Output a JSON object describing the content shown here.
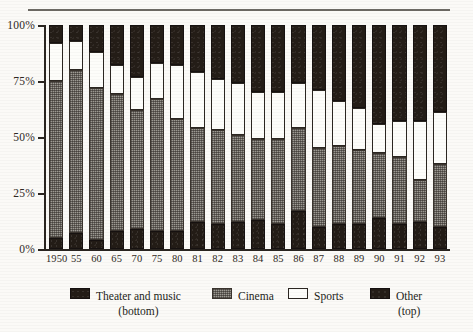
{
  "chart_data": {
    "type": "bar",
    "title": "",
    "xlabel": "",
    "ylabel": "",
    "ylim": [
      0,
      100
    ],
    "stacked": true,
    "grid": false,
    "legend_position": "bottom",
    "ytick_labels": [
      "100%",
      "75%",
      "50%",
      "25%",
      "0%"
    ],
    "ytick_values": [
      100,
      75,
      50,
      25,
      0
    ],
    "categories": [
      "1950",
      "55",
      "60",
      "65",
      "70",
      "75",
      "80",
      "81",
      "82",
      "83",
      "84",
      "85",
      "86",
      "87",
      "88",
      "89",
      "90",
      "91",
      "92",
      "93"
    ],
    "series": [
      {
        "name": "Theater and music",
        "note": "(bottom)",
        "color": "#231c16",
        "values": [
          5,
          7,
          4,
          8,
          9,
          8,
          8,
          12,
          11,
          12,
          13,
          11,
          17,
          10,
          11,
          11,
          14,
          11,
          12,
          10
        ]
      },
      {
        "name": "Cinema",
        "note": "",
        "color": "#9d9a93",
        "values": [
          70,
          73,
          68,
          61,
          53,
          59,
          50,
          42,
          42,
          39,
          36,
          38,
          37,
          35,
          35,
          33,
          29,
          30,
          19,
          28
        ]
      },
      {
        "name": "Sports",
        "note": "",
        "color": "#fdfdfa",
        "values": [
          17,
          13,
          16,
          13,
          15,
          16,
          24,
          25,
          23,
          23,
          21,
          21,
          20,
          26,
          20,
          19,
          13,
          16,
          26,
          23
        ]
      },
      {
        "name": "Other",
        "note": "(top)",
        "color": "#241d17",
        "values": [
          8,
          7,
          12,
          18,
          23,
          17,
          18,
          21,
          24,
          26,
          30,
          30,
          26,
          29,
          34,
          37,
          44,
          43,
          43,
          39
        ]
      }
    ],
    "cumulative_tops": {
      "theater": [
        5,
        7,
        4,
        8,
        9,
        8,
        8,
        12,
        11,
        12,
        13,
        11,
        17,
        10,
        11,
        11,
        14,
        11,
        12,
        10
      ],
      "cinema": [
        75,
        80,
        72,
        69,
        62,
        67,
        58,
        54,
        53,
        51,
        49,
        49,
        54,
        45,
        46,
        44,
        43,
        41,
        31,
        38
      ],
      "sports": [
        92,
        93,
        88,
        82,
        77,
        83,
        82,
        79,
        76,
        74,
        70,
        70,
        74,
        71,
        66,
        63,
        56,
        57,
        57,
        61
      ],
      "other": [
        100,
        100,
        100,
        100,
        100,
        100,
        100,
        100,
        100,
        100,
        100,
        100,
        100,
        100,
        100,
        100,
        100,
        100,
        100,
        100
      ]
    }
  },
  "legend": {
    "items": [
      {
        "label": "Theater and music",
        "sub": "(bottom)",
        "swatch": "theater-swatch"
      },
      {
        "label": "Cinema",
        "sub": "",
        "swatch": "cinema-swatch"
      },
      {
        "label": "Sports",
        "sub": "",
        "swatch": "sports-swatch"
      },
      {
        "label": "Other",
        "sub": "(top)",
        "swatch": "other-swatch"
      }
    ]
  }
}
